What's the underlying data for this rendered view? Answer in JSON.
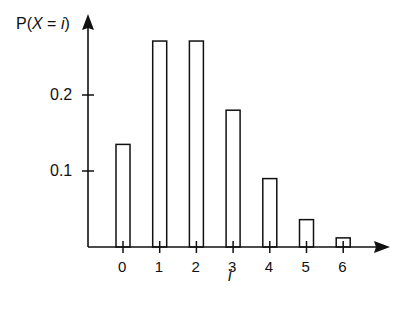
{
  "chart_data": {
    "type": "bar",
    "title": "",
    "xlabel": "i",
    "ylabel": "P(X = i)",
    "categories": [
      "0",
      "1",
      "2",
      "3",
      "4",
      "5",
      "6"
    ],
    "values": [
      0.135,
      0.271,
      0.271,
      0.18,
      0.09,
      0.036,
      0.012
    ],
    "yticks": [
      "0.1",
      "0.2"
    ],
    "ylim": [
      0,
      0.3
    ],
    "grid": false,
    "legend": null,
    "bar_style": "outline"
  },
  "labels": {
    "ylabel_prefix": "P(",
    "ylabel_var": "X",
    "ylabel_mid": " = ",
    "ylabel_idx": "i",
    "ylabel_suffix": ")",
    "xlabel": "i"
  }
}
